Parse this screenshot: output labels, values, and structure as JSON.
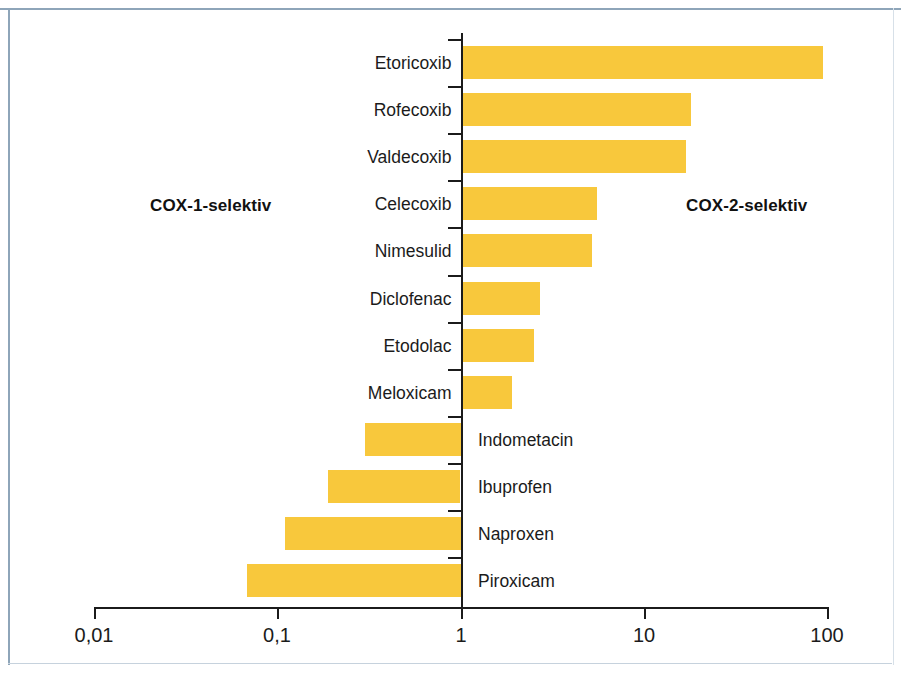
{
  "figure": {
    "background_color": "#ffffff",
    "frame_color": "#8ea5b9",
    "bar_color": "#f8c83c",
    "axis_color": "#1b1b1b"
  },
  "annotations": {
    "left_region": "COX-1-selektiv",
    "right_region": "COX-2-selektiv"
  },
  "axis": {
    "tick_labels": [
      "0,01",
      "0,1",
      "1",
      "100",
      "10"
    ],
    "t0": "0,01",
    "t1": "0,1",
    "t2": "1",
    "t3": "10",
    "t4": "100"
  },
  "labels": {
    "etoricoxib": "Etoricoxib",
    "rofecoxib": "Rofecoxib",
    "valdecoxib": "Valdecoxib",
    "celecoxib": "Celecoxib",
    "nimesulid": "Nimesulid",
    "diclofenac": "Diclofenac",
    "etodolac": "Etodolac",
    "meloxicam": "Meloxicam",
    "indometacin": "Indometacin",
    "ibuprofen": "Ibuprofen",
    "naproxen": "Naproxen",
    "piroxicam": "Piroxicam"
  },
  "chart_data": {
    "type": "bar",
    "orientation": "horizontal",
    "title": "",
    "xlabel": "",
    "ylabel": "",
    "xscale": "log",
    "xlim": [
      0.01,
      100
    ],
    "xticks": [
      0.01,
      0.1,
      1,
      10,
      100
    ],
    "xticklabels": [
      "0,01",
      "0,1",
      "1",
      "10",
      "100"
    ],
    "baseline": 1,
    "grid": false,
    "legend": false,
    "bar_color": "#f8c83c",
    "annotations": [
      {
        "text": "COX-1-selektiv",
        "side": "left",
        "bold": true
      },
      {
        "text": "COX-2-selektiv",
        "side": "right",
        "bold": true
      }
    ],
    "categories": [
      "Etoricoxib",
      "Rofecoxib",
      "Valdecoxib",
      "Celecoxib",
      "Nimesulid",
      "Diclofenac",
      "Etodolac",
      "Meloxicam",
      "Indometacin",
      "Ibuprofen",
      "Naproxen",
      "Piroxicam"
    ],
    "values": [
      95,
      18,
      17,
      5.5,
      5.2,
      2.7,
      2.5,
      1.9,
      0.3,
      0.19,
      0.11,
      0.068
    ],
    "series": [
      {
        "name": "COX-2/COX-1 Selektivitätsquotient",
        "points": [
          {
            "category": "Etoricoxib",
            "value": 95,
            "side": "right"
          },
          {
            "category": "Rofecoxib",
            "value": 18,
            "side": "right"
          },
          {
            "category": "Valdecoxib",
            "value": 17,
            "side": "right"
          },
          {
            "category": "Celecoxib",
            "value": 5.5,
            "side": "right"
          },
          {
            "category": "Nimesulid",
            "value": 5.2,
            "side": "right"
          },
          {
            "category": "Diclofenac",
            "value": 2.7,
            "side": "right"
          },
          {
            "category": "Etodolac",
            "value": 2.5,
            "side": "right"
          },
          {
            "category": "Meloxicam",
            "value": 1.9,
            "side": "right"
          },
          {
            "category": "Indometacin",
            "value": 0.3,
            "side": "left"
          },
          {
            "category": "Ibuprofen",
            "value": 0.19,
            "side": "left"
          },
          {
            "category": "Naproxen",
            "value": 0.11,
            "side": "left"
          },
          {
            "category": "Piroxicam",
            "value": 0.068,
            "side": "left"
          }
        ]
      }
    ]
  }
}
